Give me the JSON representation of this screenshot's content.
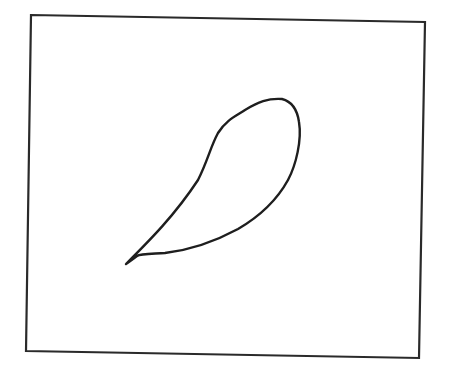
{
  "figure": {
    "colors": {
      "background": "#ffffff",
      "stroke": "#1e1e1e"
    },
    "frame": {
      "corners": {
        "top_left": [
          31,
          15
        ],
        "top_right": [
          425,
          22
        ],
        "bottom_right": [
          419,
          358
        ],
        "bottom_left": [
          26,
          351
        ]
      }
    },
    "shape": {
      "type": "teardrop",
      "tip": [
        126,
        264
      ],
      "top": [
        280,
        99
      ],
      "rightmost": [
        299,
        130
      ]
    }
  }
}
